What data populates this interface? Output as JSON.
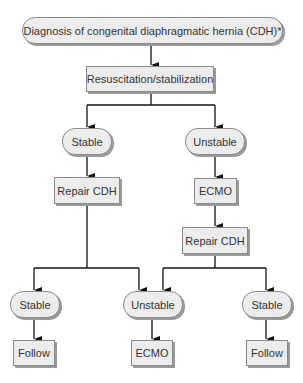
{
  "diagram": {
    "type": "flowchart",
    "nodes": {
      "diagnosis": "Diagnosis of congenital diaphragmatic hernia (CDH)*",
      "resuscitation": "Resuscitation/stabilization",
      "stable_1": "Stable",
      "unstable_1": "Unstable",
      "repair_left": "Repair CDH",
      "ecmo_1": "ECMO",
      "repair_right": "Repair CDH",
      "stable_2": "Stable",
      "unstable_2": "Unstable",
      "stable_3": "Stable",
      "follow_1": "Follow",
      "ecmo_2": "ECMO",
      "follow_2": "Follow"
    },
    "edges": [
      [
        "diagnosis",
        "resuscitation"
      ],
      [
        "resuscitation",
        "stable_1"
      ],
      [
        "resuscitation",
        "unstable_1"
      ],
      [
        "stable_1",
        "repair_left"
      ],
      [
        "unstable_1",
        "ecmo_1"
      ],
      [
        "ecmo_1",
        "repair_right"
      ],
      [
        "repair_left",
        "stable_2"
      ],
      [
        "repair_left",
        "unstable_2"
      ],
      [
        "repair_right",
        "unstable_2"
      ],
      [
        "repair_right",
        "stable_3"
      ],
      [
        "stable_2",
        "follow_1"
      ],
      [
        "unstable_2",
        "ecmo_2"
      ],
      [
        "stable_3",
        "follow_2"
      ]
    ],
    "colors": {
      "node_fill": "#ececec",
      "node_border": "#8a8a8a",
      "shadow": "#9a9a9a",
      "line": "#111111",
      "text": "#333333"
    }
  }
}
